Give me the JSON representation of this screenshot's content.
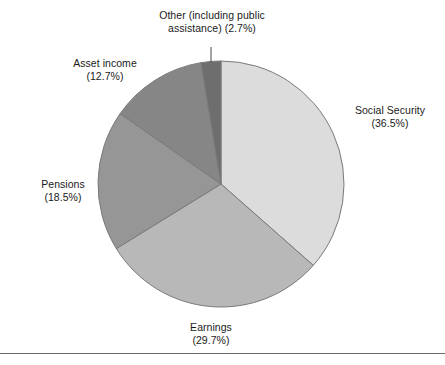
{
  "figure": {
    "background_color": "#ffffff",
    "rule_color": "#6b6b6b"
  },
  "chart_data": {
    "type": "pie",
    "title": "",
    "subtitle": "",
    "xlabel": "",
    "ylabel": "",
    "legend_position": "none",
    "grid": false,
    "start_angle_deg": 0,
    "direction": "clockwise",
    "categories": [
      "Social Security",
      "Earnings",
      "Pensions",
      "Asset income",
      "Other (including public assistance)"
    ],
    "values": [
      36.5,
      29.7,
      18.5,
      12.7,
      2.7
    ],
    "units": "percent",
    "colors": [
      "#dcdcdc",
      "#b8b8b8",
      "#969696",
      "#868686",
      "#6e6e6e"
    ],
    "slice_edge_color": "#7a7a7a",
    "center": {
      "x": 221,
      "y": 184
    },
    "radius": 123,
    "slices": [
      {
        "name": "Social Security",
        "value": 36.5,
        "label_line1": "Social Security",
        "label_line2": "(36.5%)",
        "color": "#dcdcdc",
        "start_deg": 0.0,
        "end_deg": 131.4,
        "leader_line": false
      },
      {
        "name": "Earnings",
        "value": 29.7,
        "label_line1": "Earnings",
        "label_line2": "(29.7%)",
        "color": "#b8b8b8",
        "start_deg": 131.4,
        "end_deg": 238.32,
        "leader_line": false
      },
      {
        "name": "Pensions",
        "value": 18.5,
        "label_line1": "Pensions",
        "label_line2": "(18.5%)",
        "color": "#969696",
        "start_deg": 238.32,
        "end_deg": 304.92,
        "leader_line": false
      },
      {
        "name": "Asset income",
        "value": 12.7,
        "label_line1": "Asset income",
        "label_line2": "(12.7%)",
        "color": "#868686",
        "start_deg": 304.92,
        "end_deg": 350.64,
        "leader_line": false
      },
      {
        "name": "Other (including public assistance)",
        "value": 2.7,
        "label_line1": "Other (including public",
        "label_line2": "assistance) (2.7%)",
        "color": "#6e6e6e",
        "start_deg": 350.64,
        "end_deg": 360.0,
        "leader_line": true
      }
    ]
  },
  "labels": {
    "other": "Other (including public\nassistance) (2.7%)",
    "asset_income": "Asset income\n(12.7%)",
    "social_security": "Social Security\n(36.5%)",
    "pensions": "Pensions\n(18.5%)",
    "earnings": "Earnings\n(29.7%)"
  }
}
